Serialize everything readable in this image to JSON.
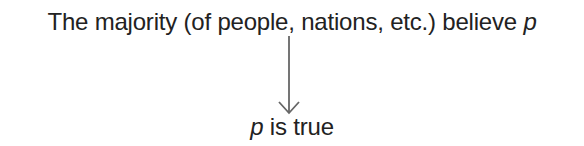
{
  "diagram": {
    "premise": {
      "text": "The majority (of people, nations, etc.) believe",
      "variable": "p"
    },
    "arrow": {
      "direction": "down",
      "color": "#666666"
    },
    "conclusion": {
      "variable": "p",
      "text": "is true"
    }
  }
}
